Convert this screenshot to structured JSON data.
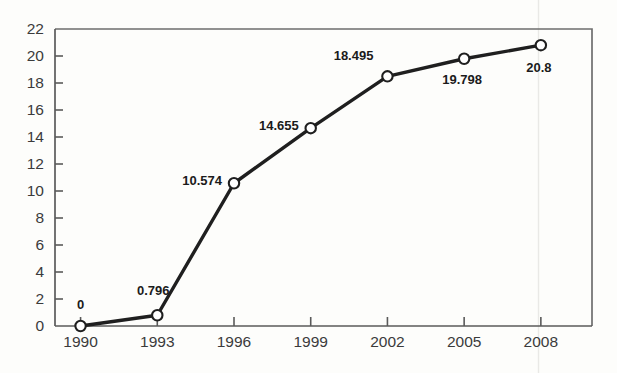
{
  "chart_data": {
    "type": "line",
    "title": "",
    "subtitle": "",
    "xlabel": "",
    "ylabel": "",
    "categories": [
      "1990",
      "1993",
      "1996",
      "1999",
      "2002",
      "2005",
      "2008"
    ],
    "x": [
      1990,
      1993,
      1996,
      1999,
      2002,
      2005,
      2008
    ],
    "values": [
      0,
      0.796,
      10.574,
      14.655,
      18.495,
      19.798,
      20.8
    ],
    "point_labels": [
      "0",
      "0.796",
      "10.574",
      "14.655",
      "18.495",
      "19.798",
      "20.8"
    ],
    "series": [
      {
        "name": "",
        "values": [
          0,
          0.796,
          10.574,
          14.655,
          18.495,
          19.798,
          20.8
        ]
      }
    ],
    "xlim": [
      1989.0,
      2010.0
    ],
    "ylim": [
      0,
      22
    ],
    "ytick_labels": [
      "0",
      "2",
      "4",
      "6",
      "8",
      "10",
      "12",
      "14",
      "16",
      "18",
      "20",
      "22"
    ],
    "ytick_values": [
      0,
      2,
      4,
      6,
      8,
      10,
      12,
      14,
      16,
      18,
      20,
      22
    ],
    "xtick_labels": [
      "1990",
      "1993",
      "1996",
      "1999",
      "2002",
      "2005",
      "2008"
    ],
    "grid": false,
    "legend": "none",
    "marker": "open-circle",
    "line_color": "#1f1f1f",
    "marker_fill": "#ffffff",
    "background_color": "#fdfdfb",
    "axis_color": "#5a5a5a"
  }
}
